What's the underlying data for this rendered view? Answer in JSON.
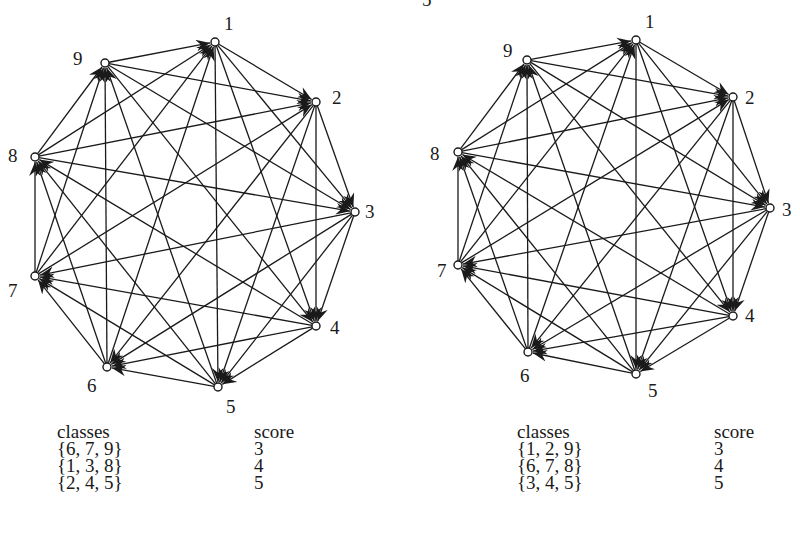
{
  "top_fragment": "5",
  "graphs": [
    {
      "id": "left",
      "nodes": [
        {
          "label": "1",
          "x": 215,
          "y": 42,
          "lx": 224,
          "ly": 30
        },
        {
          "label": "2",
          "x": 316,
          "y": 102,
          "lx": 332,
          "ly": 104
        },
        {
          "label": "3",
          "x": 355,
          "y": 212,
          "lx": 365,
          "ly": 218
        },
        {
          "label": "4",
          "x": 316,
          "y": 326,
          "lx": 330,
          "ly": 334
        },
        {
          "label": "5",
          "x": 218,
          "y": 387,
          "lx": 226,
          "ly": 413
        },
        {
          "label": "6",
          "x": 107,
          "y": 367,
          "lx": 87,
          "ly": 392
        },
        {
          "label": "7",
          "x": 35,
          "y": 276,
          "lx": 8,
          "ly": 297
        },
        {
          "label": "8",
          "x": 35,
          "y": 157,
          "lx": 8,
          "ly": 162
        },
        {
          "label": "9",
          "x": 105,
          "y": 63,
          "lx": 73,
          "ly": 65
        }
      ],
      "table": {
        "x": 57,
        "y": 423,
        "headers": [
          "classes",
          "score"
        ],
        "rows": [
          {
            "classes": "{6, 7, 9}",
            "score": "3"
          },
          {
            "classes": "{1, 3, 8}",
            "score": "4"
          },
          {
            "classes": "{2, 4, 5}",
            "score": "5"
          }
        ]
      }
    },
    {
      "id": "right",
      "nodes": [
        {
          "label": "1",
          "x": 636,
          "y": 40,
          "lx": 645,
          "ly": 28
        },
        {
          "label": "2",
          "x": 733,
          "y": 97,
          "lx": 745,
          "ly": 104
        },
        {
          "label": "3",
          "x": 770,
          "y": 208,
          "lx": 782,
          "ly": 216
        },
        {
          "label": "4",
          "x": 733,
          "y": 316,
          "lx": 745,
          "ly": 322
        },
        {
          "label": "5",
          "x": 636,
          "y": 374,
          "lx": 648,
          "ly": 397
        },
        {
          "label": "6",
          "x": 528,
          "y": 352,
          "lx": 520,
          "ly": 382
        },
        {
          "label": "7",
          "x": 458,
          "y": 265,
          "lx": 437,
          "ly": 277
        },
        {
          "label": "8",
          "x": 458,
          "y": 152,
          "lx": 430,
          "ly": 160
        },
        {
          "label": "9",
          "x": 527,
          "y": 60,
          "lx": 503,
          "ly": 57
        }
      ],
      "table": {
        "x": 517,
        "y": 423,
        "headers": [
          "classes",
          "score"
        ],
        "rows": [
          {
            "classes": "{1, 2, 9}",
            "score": "3"
          },
          {
            "classes": "{6, 7, 8}",
            "score": "4"
          },
          {
            "classes": "{3, 4, 5}",
            "score": "5"
          }
        ]
      }
    }
  ]
}
